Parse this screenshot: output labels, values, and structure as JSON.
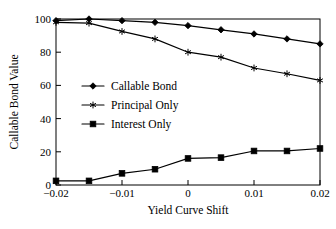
{
  "chart_data": {
    "type": "line",
    "title": "",
    "xlabel": "Yield Curve Shift",
    "ylabel": "Callable Bond Value",
    "x": [
      -0.02,
      -0.015,
      -0.01,
      -0.005,
      0,
      0.005,
      0.01,
      0.015,
      0.02
    ],
    "xlim": [
      -0.02,
      0.02
    ],
    "ylim": [
      0,
      100
    ],
    "xticks": [
      -0.02,
      -0.01,
      0,
      0.01,
      0.02
    ],
    "xtick_labels": [
      "−0.02",
      "−0.01",
      "0",
      "0.01",
      "0.02"
    ],
    "yticks": [
      0,
      20,
      40,
      60,
      80,
      100
    ],
    "ytick_labels": [
      "0",
      "20",
      "40",
      "60",
      "80",
      "100"
    ],
    "grid": false,
    "legend_position": "center-left-inside",
    "series": [
      {
        "name": "Callable Bond",
        "marker": "diamond",
        "color": "#000000",
        "values": [
          99,
          100,
          99,
          98,
          96,
          93.5,
          91,
          88,
          85
        ]
      },
      {
        "name": "Principal Only",
        "marker": "star",
        "color": "#000000",
        "values": [
          98,
          97.5,
          92.5,
          88,
          80,
          77,
          70.5,
          67,
          63
        ]
      },
      {
        "name": "Interest Only",
        "marker": "square",
        "color": "#000000",
        "values": [
          2.5,
          2.5,
          7,
          9.5,
          16,
          16.5,
          20.5,
          20.5,
          22
        ]
      }
    ]
  },
  "legend": {
    "entries": [
      {
        "label": "Callable Bond"
      },
      {
        "label": "Principal Only"
      },
      {
        "label": "Interest Only"
      }
    ]
  },
  "axis": {
    "x_title": "Yield Curve Shift",
    "y_title": "Callable Bond Value"
  }
}
